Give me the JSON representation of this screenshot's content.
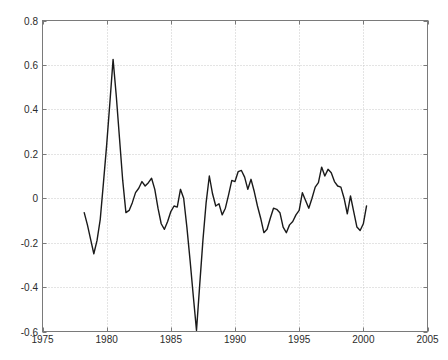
{
  "figure": {
    "title": "",
    "background_color": "#ffffff",
    "axes_color": "#7a7a7a",
    "grid_color": "#c8c8c8",
    "line_color": "#1a1a1a",
    "tick_text_color": "#2b2b2b"
  },
  "axes": {
    "x": {
      "min": 1975,
      "max": 2005,
      "tick_labels": [
        "1975",
        "1980",
        "1985",
        "1990",
        "1995",
        "2000",
        "2005"
      ],
      "tick_values": [
        1975,
        1980,
        1985,
        1990,
        1995,
        2000,
        2005
      ],
      "label": ""
    },
    "y": {
      "min": -0.6,
      "max": 0.8,
      "tick_labels": [
        "0.8",
        "0.6",
        "0.4",
        "0.2",
        "0",
        "-0.2",
        "-0.4",
        "-0.6"
      ],
      "tick_values": [
        0.8,
        0.6,
        0.4,
        0.2,
        0,
        -0.2,
        -0.4,
        -0.6
      ],
      "label": ""
    }
  },
  "chart_data": {
    "type": "line",
    "title": "",
    "xlabel": "",
    "ylabel": "",
    "xlim": [
      1975,
      2005
    ],
    "ylim": [
      -0.6,
      0.8
    ],
    "grid": true,
    "grid_style": "dotted",
    "legend": null,
    "series": [
      {
        "name": "series-1",
        "color": "#1a1a1a",
        "line_width": 1.4,
        "x": [
          1978.25,
          1978.5,
          1978.75,
          1979.0,
          1979.25,
          1979.5,
          1979.75,
          1980.0,
          1980.25,
          1980.5,
          1980.75,
          1981.0,
          1981.25,
          1981.5,
          1981.75,
          1982.0,
          1982.25,
          1982.5,
          1982.75,
          1983.0,
          1983.25,
          1983.5,
          1983.75,
          1984.0,
          1984.25,
          1984.5,
          1984.75,
          1985.0,
          1985.25,
          1985.5,
          1985.75,
          1986.0,
          1986.25,
          1986.5,
          1986.75,
          1987.0,
          1987.25,
          1987.5,
          1987.75,
          1988.0,
          1988.25,
          1988.5,
          1988.75,
          1989.0,
          1989.25,
          1989.5,
          1989.75,
          1990.0,
          1990.25,
          1990.5,
          1990.75,
          1991.0,
          1991.25,
          1991.5,
          1991.75,
          1992.0,
          1992.25,
          1992.5,
          1992.75,
          1993.0,
          1993.25,
          1993.5,
          1993.75,
          1994.0,
          1994.25,
          1994.5,
          1994.75,
          1995.0,
          1995.25,
          1995.5,
          1995.75,
          1996.0,
          1996.25,
          1996.5,
          1996.75,
          1997.0,
          1997.25,
          1997.5,
          1997.75,
          1998.0,
          1998.25,
          1998.5,
          1998.75,
          1999.0,
          1999.25,
          1999.5,
          1999.75,
          2000.0,
          2000.25
        ],
        "y": [
          -0.065,
          -0.12,
          -0.185,
          -0.25,
          -0.19,
          -0.095,
          0.07,
          0.24,
          0.43,
          0.625,
          0.46,
          0.27,
          0.08,
          -0.065,
          -0.055,
          -0.02,
          0.025,
          0.045,
          0.075,
          0.055,
          0.07,
          0.09,
          0.04,
          -0.045,
          -0.115,
          -0.14,
          -0.105,
          -0.06,
          -0.035,
          -0.04,
          0.04,
          0.0,
          -0.13,
          -0.28,
          -0.44,
          -0.595,
          -0.39,
          -0.19,
          -0.02,
          0.1,
          0.02,
          -0.035,
          -0.025,
          -0.075,
          -0.045,
          0.015,
          0.08,
          0.075,
          0.12,
          0.125,
          0.095,
          0.04,
          0.085,
          0.03,
          -0.035,
          -0.09,
          -0.155,
          -0.14,
          -0.09,
          -0.045,
          -0.05,
          -0.065,
          -0.13,
          -0.155,
          -0.12,
          -0.105,
          -0.075,
          -0.055,
          0.025,
          -0.01,
          -0.045,
          0.0,
          0.05,
          0.07,
          0.14,
          0.1,
          0.13,
          0.115,
          0.075,
          0.055,
          0.05,
          0.0,
          -0.07,
          0.01,
          -0.06,
          -0.13,
          -0.145,
          -0.115,
          -0.035
        ]
      }
    ]
  }
}
